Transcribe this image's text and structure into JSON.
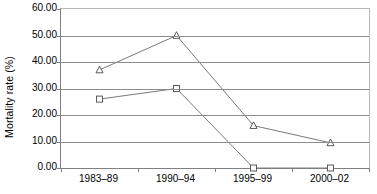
{
  "chart_data": {
    "type": "line",
    "title": "",
    "xlabel": "",
    "ylabel": "Mortality rate (%)",
    "categories": [
      "1983–89",
      "1990–94",
      "1995–99",
      "2000–02"
    ],
    "ylim": [
      0,
      60
    ],
    "yticks": [
      0,
      10,
      20,
      30,
      40,
      50,
      60
    ],
    "ytick_labels": [
      "0.00",
      "10.00",
      "20.00",
      "30.00",
      "40.00",
      "50.00",
      "60.00"
    ],
    "grid": true,
    "legend": "none",
    "series": [
      {
        "name": "series-triangle",
        "marker": "triangle",
        "values": [
          37.0,
          50.0,
          16.0,
          9.5
        ]
      },
      {
        "name": "series-square",
        "marker": "square",
        "values": [
          26.0,
          30.0,
          0.0,
          0.0
        ]
      }
    ],
    "colors": {
      "line": "#7a7a7a",
      "marker_stroke": "#5a5a5a",
      "marker_fill": "#ffffff",
      "gridline": "#8c8c8c",
      "axis": "#808080"
    }
  }
}
